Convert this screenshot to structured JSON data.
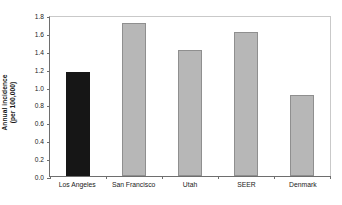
{
  "chart_data": {
    "type": "bar",
    "title": "",
    "subtitle": "",
    "xlabel": "",
    "ylabel": "Annual incidence (per 100,000)",
    "ylabel_lines": [
      "Annual incidence",
      "(per 100,000)"
    ],
    "categories": [
      "Los Angeles",
      "San Francisco",
      "Utah",
      "SEER",
      "Denmark"
    ],
    "values": [
      1.16,
      1.71,
      1.41,
      1.61,
      0.91
    ],
    "ylim": [
      0.0,
      1.8
    ],
    "ytick_labels": [
      "0.0",
      "0.2",
      "0.4",
      "0.6",
      "0.8",
      "1.0",
      "1.2",
      "1.4",
      "1.6",
      "1.8"
    ],
    "ytick_values": [
      0.0,
      0.2,
      0.4,
      0.6,
      0.8,
      1.0,
      1.2,
      1.4,
      1.6,
      1.8
    ],
    "grid": false,
    "legend": "none",
    "bar_colors": [
      "#161616",
      "#b7b7b7",
      "#b7b7b7",
      "#b7b7b7",
      "#b7b7b7"
    ],
    "highlight_category": "Los Angeles",
    "colors": {
      "background": "#ffffff",
      "bar_gray_fill": "#b7b7b7",
      "bar_gray_edge": "#8f8f8f",
      "bar_dark_fill": "#161616",
      "axis_line": "#6e6e6e",
      "frame_line": "#c9c9c9",
      "text": "#1a1a1a"
    }
  }
}
